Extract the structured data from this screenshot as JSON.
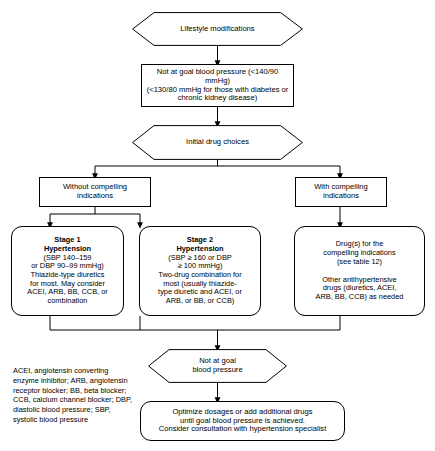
{
  "diagram": {
    "stroke_color": "#000000",
    "background_color": "#ffffff",
    "nodes": {
      "lifestyle": {
        "shape": "hexagon",
        "text": "Lifestyle modifications"
      },
      "not_at_goal_top": {
        "shape": "rectangle",
        "line1": "Not at goal blood pressure (<140/90 mmHg)",
        "line2": "(<130/80 mmHg for those with diabetes or",
        "line3": "chronic kidney disease)"
      },
      "initial_drug_choices": {
        "shape": "hexagon",
        "text": "Initial drug choices"
      },
      "without_compelling": {
        "shape": "rectangle",
        "line1": "Without compelling",
        "line2": "indications"
      },
      "with_compelling": {
        "shape": "rectangle",
        "line1": "With compelling",
        "line2": "indications"
      },
      "stage1": {
        "shape": "rounded-rectangle",
        "heading1": "Stage 1",
        "heading2": "Hypertension",
        "line1": "(SBP 140–159",
        "line2": "or DBP 90–99 mmHg)",
        "line3": "Thiazide-type diuretics",
        "line4": "for most. May consider",
        "line5": "ACEI, ARB, BB, CCB, or",
        "line6": "combination"
      },
      "stage2": {
        "shape": "rounded-rectangle",
        "heading1": "Stage 2",
        "heading2": "Hypertension",
        "line1": "(SBP ≥ 160 or DBP",
        "line2": "≥ 100 mmHg)",
        "line3": "Two-drug combination for",
        "line4": "most (usually thiazide-",
        "line5": "type diuretic and ACEI, or",
        "line6": "ARB, or BB, or CCB)"
      },
      "compelling_drugs": {
        "shape": "rounded-rectangle",
        "line1": "Drug(s) for the",
        "line2": "compelling indications",
        "line3": "(see table 12)",
        "line4": "Other antihypertensive",
        "line5": "drugs (diuretics, ACEI,",
        "line6": "ARB, BB, CCB) as needed"
      },
      "not_at_goal_bottom": {
        "shape": "hexagon",
        "line1": "Not at goal",
        "line2": "blood pressure"
      },
      "optimize": {
        "shape": "rounded-rectangle",
        "line1": "Optimize dosages or add additional drugs",
        "line2": "until goal blood pressure is achieved.",
        "line3": "Consider consultation with hypertension specialist"
      }
    },
    "legend": {
      "text": "ACEI, angiotensin converting enzyme inhibitor; ARB, angiotensin receptor blocker; BB, beta blocker; CCB, calcium channel blocker; DBP, diastolic blood pressure; SBP, systolic blood pressure"
    }
  }
}
